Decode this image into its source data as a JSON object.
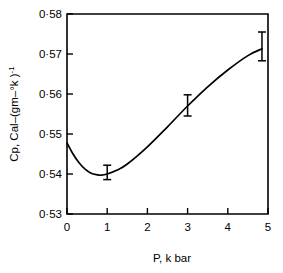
{
  "chart_data": {
    "type": "line",
    "title": "",
    "xlabel": "P, k bar",
    "ylabel": "Cp, Cal–(gm–°k )",
    "ylabel_exponent": "-1",
    "xlim": [
      0,
      5
    ],
    "ylim": [
      0.53,
      0.58
    ],
    "grid": false,
    "legend": null,
    "xticks": [
      0,
      1,
      2,
      3,
      4,
      5
    ],
    "xtick_labels": [
      "0",
      "1",
      "2",
      "3",
      "4",
      "5"
    ],
    "yticks": [
      0.53,
      0.54,
      0.55,
      0.56,
      0.57,
      0.58
    ],
    "ytick_labels": [
      "0·53",
      "0·54",
      "0·55",
      "0·56",
      "0·57",
      "0·58"
    ],
    "series": [
      {
        "name": "Cp vs P",
        "x": [
          0.0,
          0.15,
          0.3,
          0.45,
          0.6,
          0.75,
          0.85,
          1.0,
          1.25,
          1.5,
          2.0,
          2.5,
          3.0,
          3.5,
          4.0,
          4.5,
          4.85
        ],
        "y": [
          0.5478,
          0.545,
          0.5428,
          0.5412,
          0.5402,
          0.5398,
          0.5397,
          0.54,
          0.541,
          0.5425,
          0.5468,
          0.5518,
          0.557,
          0.5618,
          0.566,
          0.5696,
          0.5713
        ]
      }
    ],
    "error_bars": [
      {
        "x": 1.0,
        "y": 0.5397,
        "yerr_low": 0.5386,
        "yerr_high": 0.5422
      },
      {
        "x": 3.0,
        "y": 0.5568,
        "yerr_low": 0.5545,
        "yerr_high": 0.5598
      },
      {
        "x": 4.85,
        "y": 0.5713,
        "yerr_low": 0.5683,
        "yerr_high": 0.5755
      }
    ],
    "colors": {
      "curve": "#000000",
      "axis": "#000000",
      "background": "#ffffff",
      "text": "#000000"
    }
  }
}
